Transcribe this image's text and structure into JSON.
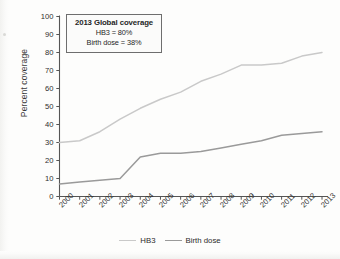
{
  "chart_data": {
    "type": "line",
    "title": "",
    "xlabel": "",
    "ylabel": "Percent coverage",
    "categories": [
      "2000",
      "2001",
      "2002",
      "2003",
      "2004",
      "2005",
      "2006",
      "2007",
      "2008",
      "2009",
      "2010",
      "2011",
      "2012",
      "2013"
    ],
    "x": [
      2000,
      2001,
      2002,
      2003,
      2004,
      2005,
      2006,
      2007,
      2008,
      2009,
      2010,
      2011,
      2012,
      2013
    ],
    "ylim": [
      0,
      100
    ],
    "yticks": [
      0,
      10,
      20,
      30,
      40,
      50,
      60,
      70,
      80,
      90,
      100
    ],
    "grid": false,
    "legend_position": "bottom",
    "series": [
      {
        "name": "HB3",
        "color": "#c9c9c9",
        "values": [
          30,
          31,
          36,
          43,
          49,
          54,
          58,
          64,
          68,
          73,
          73,
          74,
          78,
          80
        ]
      },
      {
        "name": "Birth dose",
        "color": "#9a9a9a",
        "values": [
          7,
          8,
          9,
          10,
          22,
          24,
          24,
          25,
          27,
          29,
          31,
          34,
          35,
          36
        ]
      }
    ],
    "annotation": {
      "title": "2013 Global coverage",
      "line1": "HB3 = 80%",
      "line2": "Birth dose = 38%"
    }
  },
  "axes": {
    "y_label": "Percent coverage",
    "y_ticks": [
      "100",
      "90",
      "80",
      "70",
      "60",
      "50",
      "40",
      "30",
      "20",
      "10",
      "0"
    ],
    "x_ticks": [
      "2000",
      "2001",
      "2002",
      "2003",
      "2004",
      "2005",
      "2006",
      "2007",
      "2008",
      "2009",
      "2010",
      "2011",
      "2012",
      "2013"
    ]
  },
  "annotation": {
    "title": "2013 Global coverage",
    "line1": "HB3 = 80%",
    "line2": "Birth dose = 38%"
  },
  "legend": {
    "items": [
      {
        "label": "HB3",
        "color": "#c9c9c9"
      },
      {
        "label": "Birth dose",
        "color": "#9a9a9a"
      }
    ]
  }
}
